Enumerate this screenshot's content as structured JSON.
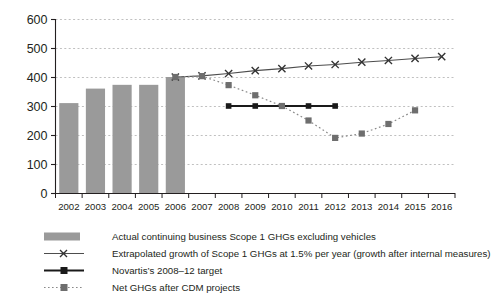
{
  "chart_data": {
    "type": "bar",
    "title": "",
    "xlabel": "",
    "ylabel": "",
    "ylim": [
      0,
      600
    ],
    "ytick_step": 100,
    "grid": true,
    "legend_position": "bottom",
    "categories": [
      "2002",
      "2003",
      "2004",
      "2005",
      "2006",
      "2007",
      "2008",
      "2009",
      "2010",
      "2011",
      "2012",
      "2013",
      "2014",
      "2015",
      "2016"
    ],
    "yticks": [
      "0",
      "100",
      "200",
      "300",
      "400",
      "500",
      "600"
    ],
    "series": [
      {
        "name": "Actual continuing business Scope 1 GHGs excluding vehicles",
        "type": "bar",
        "marker": "filled-rect",
        "color": "#9a9a9a",
        "values": [
          310,
          360,
          373,
          373,
          400,
          null,
          null,
          null,
          null,
          null,
          null,
          null,
          null,
          null,
          null
        ]
      },
      {
        "name": "Extrapolated growth of Scope 1 GHGs at 1.5% per year (growth after internal measures)",
        "type": "line",
        "marker": "x",
        "color": "#4d4d4d",
        "values": [
          null,
          null,
          null,
          null,
          400,
          404,
          412,
          422,
          429,
          438,
          443,
          451,
          457,
          464,
          470
        ]
      },
      {
        "name": "Novartis's 2008–12 target",
        "type": "line",
        "marker": "square",
        "color": "#1a1a1a",
        "values": [
          null,
          null,
          null,
          null,
          null,
          null,
          300,
          300,
          300,
          300,
          300,
          null,
          null,
          null,
          null
        ]
      },
      {
        "name": "Net GHGs after CDM projects",
        "type": "line-dotted",
        "marker": "square",
        "color": "#808080",
        "values": [
          null,
          null,
          null,
          null,
          400,
          403,
          372,
          337,
          300,
          250,
          190,
          205,
          238,
          285,
          null
        ]
      }
    ]
  },
  "legend": {
    "items": [
      {
        "label": "Actual continuing business Scope 1 GHGs excluding vehicles",
        "key": "bar-swatch"
      },
      {
        "label": "Extrapolated growth of Scope 1 GHGs at 1.5% per year (growth after internal measures)",
        "key": "line-x-marker"
      },
      {
        "label": "Novartis’s 2008–12 target",
        "key": "line-square-marker"
      },
      {
        "label": "Net GHGs after CDM projects",
        "key": "dotted-line-square-marker"
      }
    ]
  }
}
